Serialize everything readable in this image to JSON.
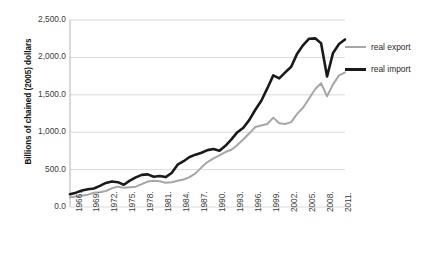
{
  "chart_data": {
    "type": "line",
    "title": "",
    "xlabel": "",
    "ylabel": "Billions of chained (2005) dollars",
    "ylim": [
      0,
      2500
    ],
    "ytick_labels": [
      "0.0",
      "500.0",
      "1,000.0",
      "1,500.0",
      "2,000.0",
      "2,500.0"
    ],
    "ytick_values": [
      0,
      500,
      1000,
      1500,
      2000,
      2500
    ],
    "grid": true,
    "legend_position": "right",
    "xtick_labels": [
      "1966.",
      "1969.",
      "1972.",
      "1975.",
      "1978.",
      "1981.",
      "1984.",
      "1987.",
      "1990.",
      "1993.",
      "1996.",
      "1999.",
      "2002.",
      "2005.",
      "2008.",
      "2011."
    ],
    "x": [
      1966,
      1967,
      1968,
      1969,
      1970,
      1971,
      1972,
      1973,
      1974,
      1975,
      1976,
      1977,
      1978,
      1979,
      1980,
      1981,
      1982,
      1983,
      1984,
      1985,
      1986,
      1987,
      1988,
      1989,
      1990,
      1991,
      1992,
      1993,
      1994,
      1995,
      1996,
      1997,
      1998,
      1999,
      2000,
      2001,
      2002,
      2003,
      2004,
      2005,
      2006,
      2007,
      2008,
      2009,
      2010,
      2011,
      2012
    ],
    "series": [
      {
        "name": "real export",
        "color": "#a6a6a6",
        "width": 2.0,
        "values": [
          130,
          140,
          152,
          165,
          190,
          196,
          214,
          268,
          300,
          296,
          305,
          308,
          345,
          395,
          444,
          450,
          410,
          392,
          416,
          424,
          460,
          518,
          610,
          680,
          740,
          790,
          840,
          865,
          935,
          1030,
          1110,
          1230,
          1245,
          1275,
          1395,
          1300,
          1300,
          1320,
          1435,
          1510,
          1650,
          1790,
          1880,
          1680,
          1850,
          1965,
          2010
        ]
      },
      {
        "name": "real import",
        "color": "#1a1a1a",
        "width": 2.6,
        "values": [
          170,
          190,
          222,
          240,
          250,
          285,
          330,
          350,
          345,
          310,
          370,
          415,
          450,
          455,
          425,
          435,
          420,
          480,
          600,
          650,
          715,
          760,
          795,
          840,
          860,
          840,
          910,
          1010,
          1125,
          1195,
          1310,
          1460,
          1600,
          1790,
          1990,
          1950,
          2040,
          2130,
          2330,
          2460,
          2570,
          2610,
          2540,
          2140,
          2400,
          2500,
          2560
        ]
      }
    ],
    "series_display": [
      {
        "name": "real export",
        "color": "#a6a6a6",
        "width": 2.0,
        "plot_values": [
          130,
          140,
          152,
          165,
          190,
          196,
          214,
          250,
          272,
          258,
          265,
          272,
          305,
          340,
          352,
          345,
          325,
          330,
          350,
          368,
          400,
          450,
          530,
          600,
          650,
          690,
          735,
          765,
          830,
          905,
          985,
          1070,
          1090,
          1110,
          1195,
          1120,
          1110,
          1135,
          1245,
          1330,
          1450,
          1575,
          1655,
          1480,
          1640,
          1760,
          1800
        ]
      },
      {
        "name": "real import",
        "color": "#1a1a1a",
        "width": 2.6,
        "plot_values": [
          170,
          192,
          220,
          238,
          248,
          282,
          322,
          340,
          332,
          298,
          352,
          396,
          430,
          436,
          405,
          415,
          400,
          455,
          565,
          612,
          668,
          700,
          725,
          760,
          775,
          752,
          818,
          905,
          1000,
          1060,
          1165,
          1300,
          1420,
          1585,
          1760,
          1720,
          1800,
          1875,
          2050,
          2165,
          2250,
          2255,
          2190,
          1745,
          2060,
          2180,
          2240
        ]
      }
    ]
  },
  "legend": {
    "items": [
      {
        "label": "real export",
        "color": "#a6a6a6",
        "thickness": "2px"
      },
      {
        "label": "real import",
        "color": "#1a1a1a",
        "thickness": "3px"
      }
    ]
  }
}
